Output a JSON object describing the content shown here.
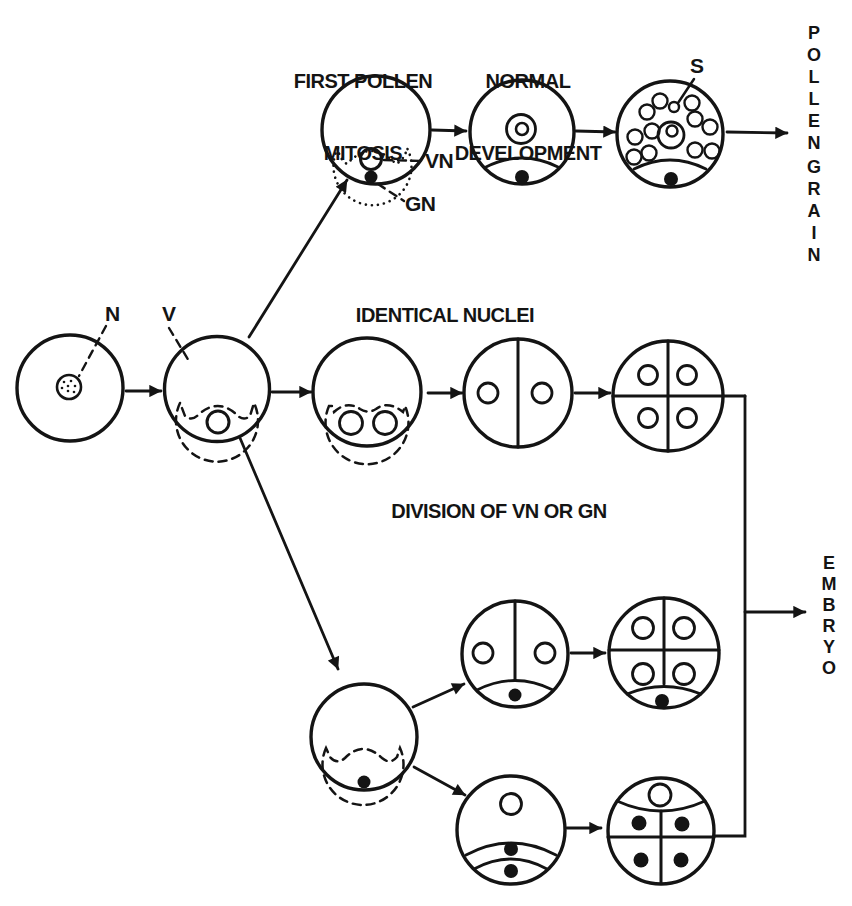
{
  "figure_title": "pollen-embryogenesis-pathways-diagram",
  "colors": {
    "ink": "#141414",
    "background": "#ffffff"
  },
  "labels": {
    "first_pollen_mitosis": {
      "line1": "FIRST POLLEN",
      "line2": "MITOSIS"
    },
    "normal_development": {
      "line1": "NORMAL",
      "line2": "DEVELOPMENT"
    },
    "identical_nuclei": "IDENTICAL NUCLEI",
    "division_of_vn_or_gn": "DIVISION OF VN OR GN"
  },
  "callouts": {
    "nucleus": "N",
    "vacuole": "V",
    "vegetative_nucleus": "VN",
    "generative_nucleus": "GN",
    "starch": "S"
  },
  "outcomes": {
    "pollen": "POLLEN",
    "grain": "GRAIN",
    "embryo": "EMBRYO"
  }
}
